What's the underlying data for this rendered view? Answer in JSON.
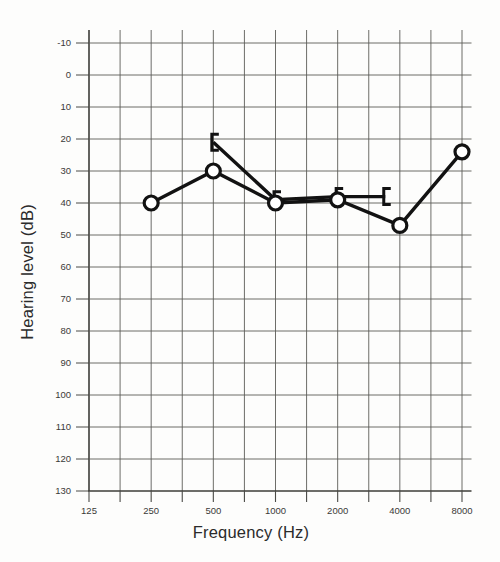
{
  "chart_data": {
    "type": "line",
    "title": "",
    "subtitle": "",
    "xlabel": "Frequency (Hz)",
    "ylabel": "Hearing level  (dB)",
    "x_tick_labels": [
      "125",
      "250",
      "500",
      "1000",
      "2000",
      "4000",
      "8000"
    ],
    "x_tick_values": [
      125,
      250,
      500,
      1000,
      2000,
      4000,
      8000
    ],
    "y_tick_labels": [
      "-10",
      "0",
      "10",
      "20",
      "30",
      "40",
      "50",
      "60",
      "70",
      "80",
      "90",
      "100",
      "110",
      "120",
      "130"
    ],
    "y_tick_values": [
      -10,
      0,
      10,
      20,
      30,
      40,
      50,
      60,
      70,
      80,
      90,
      100,
      110,
      120,
      130
    ],
    "ylim": [
      -10,
      130
    ],
    "y_inverted": true,
    "xscale": "log",
    "xlim": [
      125,
      8000
    ],
    "grid": true,
    "grid_includes_half_octaves": true,
    "legend": "none",
    "series": [
      {
        "name": "Air conduction (right ear)",
        "marker": "circle",
        "x": [
          250,
          500,
          1000,
          2000,
          4000,
          8000
        ],
        "values": [
          40,
          30,
          40,
          39,
          47,
          24
        ]
      },
      {
        "name": "Bone conduction (masked)",
        "marker": "bracket-left",
        "x": [
          500,
          1000,
          2000,
          3400
        ],
        "values": [
          21,
          39,
          38,
          38
        ]
      }
    ]
  },
  "figure": {
    "background_color": "#fdfdfc",
    "line_color": "#121212",
    "grid_color": "#5c5c58",
    "axis_color": "#3c3c38",
    "text_color": "#2b2b2b"
  }
}
